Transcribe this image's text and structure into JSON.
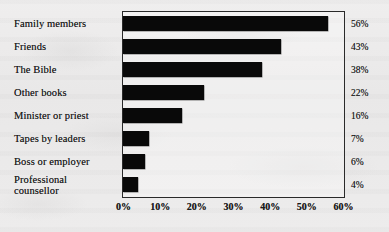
{
  "chart_data": {
    "type": "bar",
    "orientation": "horizontal",
    "title": "",
    "subtitle": "",
    "xlabel": "",
    "ylabel": "",
    "categories": [
      "Family members",
      "Friends",
      "The Bible",
      "Other books",
      "Minister or priest",
      "Tapes by leaders",
      "Boss or employer",
      "Professional\ncounsellor"
    ],
    "values": [
      56,
      43,
      38,
      22,
      16,
      7,
      6,
      4
    ],
    "value_labels": [
      "56%",
      "43%",
      "38%",
      "22%",
      "16%",
      "7%",
      "6%",
      "4%"
    ],
    "xlim": [
      0,
      60
    ],
    "xticks": [
      0,
      10,
      20,
      30,
      40,
      50,
      60
    ],
    "xtick_labels": [
      "0%",
      "10%",
      "20%",
      "30%",
      "40%",
      "50%",
      "60%"
    ],
    "grid": false,
    "legend": null,
    "bar_color": "#090909",
    "frame_color": "#2a2a2a",
    "background_color": "#ebeaea",
    "text_color": "#1b1b1b"
  }
}
